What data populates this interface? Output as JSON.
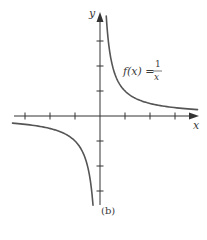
{
  "chart_data": {
    "type": "line",
    "title": "",
    "function_label": {
      "lhs": "f(x) =",
      "numerator": "1",
      "denominator": "x"
    },
    "xlabel": "x",
    "ylabel": "y",
    "caption": "(b)",
    "xlim": [
      -3.5,
      3.9
    ],
    "ylim": [
      -3.6,
      4.1
    ],
    "x_ticks": [
      -3,
      -2,
      -1,
      1,
      2,
      3
    ],
    "y_ticks": [
      -3,
      -2,
      -1,
      1,
      2,
      3
    ],
    "tick_labels_shown": false,
    "grid": false,
    "series": [
      {
        "name": "f(x) = 1/x (x > 0)",
        "x": [
          0.25,
          0.3,
          0.4,
          0.5,
          0.75,
          1,
          1.5,
          2,
          2.5,
          3,
          3.5,
          3.9
        ],
        "values": [
          4,
          3.33,
          2.5,
          2,
          1.33,
          1,
          0.67,
          0.5,
          0.4,
          0.33,
          0.29,
          0.26
        ]
      },
      {
        "name": "f(x) = 1/x (x < 0)",
        "x": [
          -3.5,
          -3,
          -2.5,
          -2,
          -1.5,
          -1,
          -0.75,
          -0.5,
          -0.4,
          -0.35,
          -0.28
        ],
        "values": [
          -0.29,
          -0.33,
          -0.4,
          -0.5,
          -0.67,
          -1,
          -1.33,
          -2,
          -2.5,
          -2.86,
          -3.57
        ]
      }
    ]
  },
  "style": {
    "axis_color": "#333333",
    "curve_color": "#555555"
  }
}
